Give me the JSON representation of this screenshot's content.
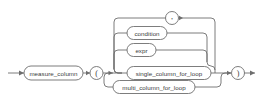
{
  "diagram": {
    "name": "measure-column-clause-railroad-diagram",
    "type": "railroad-syntax-diagram",
    "colors": {
      "background": "#ffffff",
      "line": "#6e6e6e",
      "text": "#3a3a3a"
    },
    "entry": {
      "name": "entry-arrow",
      "label": ""
    },
    "exit": {
      "name": "exit-arrow",
      "label": ""
    },
    "nonterminals": [
      {
        "id": "measure_column",
        "label": "measure_column"
      },
      {
        "id": "condition",
        "label": "condition"
      },
      {
        "id": "expr",
        "label": "expr"
      },
      {
        "id": "single_column_for_loop",
        "label": "single_column_for_loop"
      },
      {
        "id": "multi_column_for_loop",
        "label": "multi_column_for_loop"
      }
    ],
    "terminals": [
      {
        "id": "open_paren",
        "label": "("
      },
      {
        "id": "comma",
        "label": ","
      },
      {
        "id": "close_paren",
        "label": ")"
      }
    ]
  }
}
